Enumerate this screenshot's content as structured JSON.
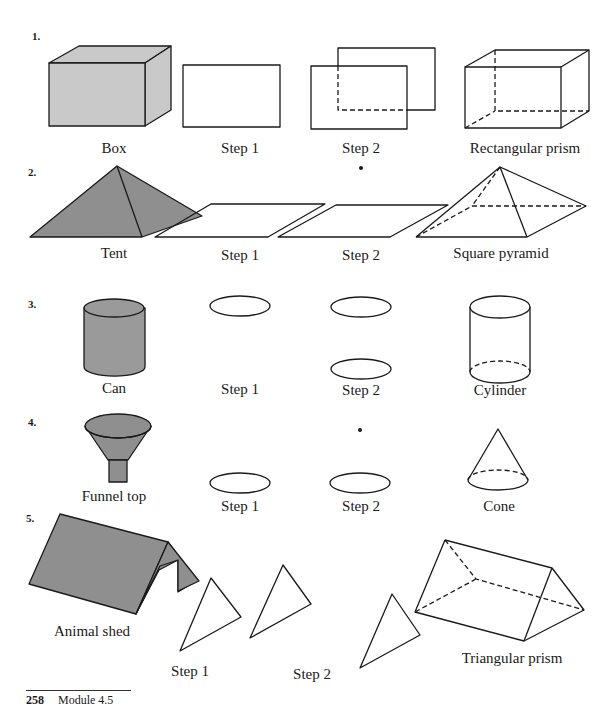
{
  "exercises": [
    {
      "number": "1.",
      "items": [
        {
          "label": "Box"
        },
        {
          "label": "Step 1"
        },
        {
          "label": "Step 2"
        },
        {
          "label": "Rectangular prism"
        }
      ]
    },
    {
      "number": "2.",
      "items": [
        {
          "label": "Tent"
        },
        {
          "label": "Step 1"
        },
        {
          "label": "Step 2"
        },
        {
          "label": "Square pyramid"
        }
      ]
    },
    {
      "number": "3.",
      "items": [
        {
          "label": "Can"
        },
        {
          "label": "Step 1"
        },
        {
          "label": "Step 2"
        },
        {
          "label": "Cylinder"
        }
      ]
    },
    {
      "number": "4.",
      "items": [
        {
          "label": "Funnel top"
        },
        {
          "label": "Step 1"
        },
        {
          "label": "Step 2"
        },
        {
          "label": "Cone"
        }
      ]
    },
    {
      "number": "5.",
      "items": [
        {
          "label": "Animal shed"
        },
        {
          "label": "Step 1"
        },
        {
          "label": "Step 2"
        },
        {
          "label": "Triangular prism"
        }
      ]
    }
  ],
  "footer": {
    "page_number": "258",
    "module": "Module 4.5"
  },
  "colors": {
    "shade_light": "#c9c9c9",
    "shade_dark": "#8a8a8a",
    "line": "#1a1a1a"
  }
}
